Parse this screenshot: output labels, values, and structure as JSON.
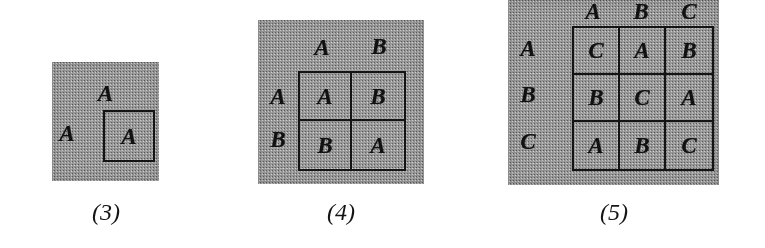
{
  "figure": {
    "kind": "cayley-tables",
    "panel_color": "#9e9e9e",
    "ink_color": "#141414",
    "figures": [
      {
        "caption": "(3)",
        "order": 1,
        "column_headers": [
          "A"
        ],
        "row_headers": [
          "A"
        ],
        "rows": [
          [
            "A"
          ]
        ]
      },
      {
        "caption": "(4)",
        "order": 2,
        "column_headers": [
          "A",
          "B"
        ],
        "row_headers": [
          "A",
          "B"
        ],
        "rows": [
          [
            "A",
            "B"
          ],
          [
            "B",
            "A"
          ]
        ]
      },
      {
        "caption": "(5)",
        "order": 3,
        "column_headers": [
          "A",
          "B",
          "C"
        ],
        "row_headers": [
          "A",
          "B",
          "C"
        ],
        "rows": [
          [
            "C",
            "A",
            "B"
          ],
          [
            "B",
            "C",
            "A"
          ],
          [
            "A",
            "B",
            "C"
          ]
        ]
      }
    ]
  }
}
